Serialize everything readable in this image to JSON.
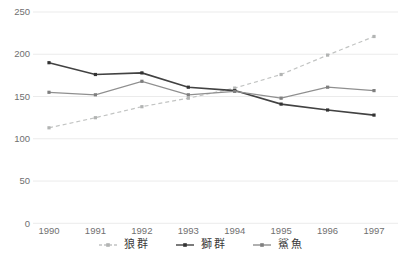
{
  "chart_data": {
    "type": "line",
    "title": "",
    "xlabel": "",
    "ylabel": "",
    "x": [
      "1990",
      "1991",
      "1992",
      "1993",
      "1994",
      "1995",
      "1996",
      "1997"
    ],
    "series": [
      {
        "name": "狼群",
        "id": "wolf-pack",
        "style": "dashed",
        "color": "#c2c4c3",
        "marker_color": "#b2b4b3",
        "values": [
          113,
          125,
          138,
          148,
          160,
          176,
          199,
          221
        ]
      },
      {
        "name": "獅群",
        "id": "lion-pride",
        "style": "solid",
        "color": "#424242",
        "marker_color": "#333333",
        "values": [
          190,
          176,
          178,
          161,
          157,
          141,
          134,
          128
        ]
      },
      {
        "name": "鯊魚",
        "id": "shark",
        "style": "solid",
        "color": "#8f8f8f",
        "marker_color": "#7f7f7f",
        "values": [
          155,
          152,
          168,
          152,
          156,
          148,
          161,
          157
        ]
      }
    ],
    "ylim": [
      0,
      250
    ],
    "yticks": [
      0,
      50,
      100,
      150,
      200,
      250
    ],
    "grid": "horizontal-only",
    "legend_position": "bottom-center"
  },
  "colors": {
    "background": "#ffffff",
    "gridline": "#ebebeb",
    "axis_label": "#707070",
    "legend_label": "#3a3a3a"
  }
}
